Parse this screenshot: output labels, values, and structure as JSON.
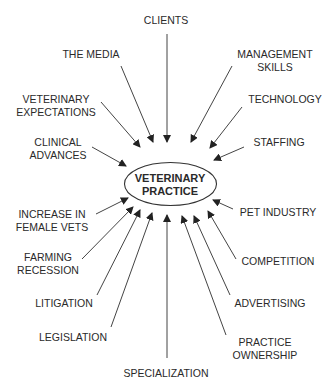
{
  "diagram": {
    "center": {
      "line1": "VETERINARY",
      "line2": "PRACTICE"
    },
    "factors": [
      {
        "id": "clients",
        "line1": "CLIENTS",
        "line2": ""
      },
      {
        "id": "the-media",
        "line1": "THE MEDIA",
        "line2": ""
      },
      {
        "id": "management-skills",
        "line1": "MANAGEMENT",
        "line2": "SKILLS"
      },
      {
        "id": "veterinary-expectations",
        "line1": "VETERINARY",
        "line2": "EXPECTATIONS"
      },
      {
        "id": "technology",
        "line1": "TECHNOLOGY",
        "line2": ""
      },
      {
        "id": "clinical-advances",
        "line1": "CLINICAL",
        "line2": "ADVANCES"
      },
      {
        "id": "staffing",
        "line1": "STAFFING",
        "line2": ""
      },
      {
        "id": "increase-in-female-vets",
        "line1": "INCREASE IN",
        "line2": "FEMALE VETS"
      },
      {
        "id": "pet-industry",
        "line1": "PET INDUSTRY",
        "line2": ""
      },
      {
        "id": "farming-recession",
        "line1": "FARMING",
        "line2": "RECESSION"
      },
      {
        "id": "competition",
        "line1": "COMPETITION",
        "line2": ""
      },
      {
        "id": "litigation",
        "line1": "LITIGATION",
        "line2": ""
      },
      {
        "id": "advertising",
        "line1": "ADVERTISING",
        "line2": ""
      },
      {
        "id": "legislation",
        "line1": "LEGISLATION",
        "line2": ""
      },
      {
        "id": "practice-ownership",
        "line1": "PRACTICE",
        "line2": "OWNERSHIP"
      },
      {
        "id": "specialization",
        "line1": "SPECIALIZATION",
        "line2": ""
      }
    ],
    "colors": {
      "stroke": "#2a2a2a",
      "text": "#2a2a2a",
      "background": "#ffffff"
    }
  }
}
